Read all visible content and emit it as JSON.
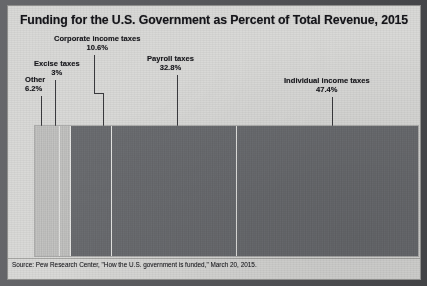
{
  "chart_data": {
    "type": "bar",
    "orientation": "horizontal-stacked",
    "title": "Funding for the U.S. Government as Percent of Total Revenue, 2015",
    "xlabel": "",
    "ylabel": "",
    "xlim": [
      0,
      100
    ],
    "grid": false,
    "legend": "none",
    "units": "percent of total revenue",
    "categories": [
      "Other",
      "Excise taxes",
      "Corporate income taxes",
      "Payroll taxes",
      "Individual income taxes"
    ],
    "values": [
      6.2,
      3,
      10.6,
      32.8,
      47.4
    ],
    "value_labels": [
      "6.2%",
      "3%",
      "10.6%",
      "32.8%",
      "47.4%"
    ],
    "colors": [
      "#c9c9c7",
      "#c9c9c7",
      "#6f7175",
      "#6f7175",
      "#6f7175"
    ],
    "annotations": [
      {
        "label": "Other",
        "value_label": "6.2%"
      },
      {
        "label": "Excise taxes",
        "value_label": "3%"
      },
      {
        "label": "Corporate income taxes",
        "value_label": "10.6%"
      },
      {
        "label": "Payroll taxes",
        "value_label": "32.8%"
      },
      {
        "label": "Individual income taxes",
        "value_label": "47.4%"
      }
    ],
    "source": "Source: Pew Research Center, \"How the U.S. government is funded,\" March 20, 2015."
  },
  "figure": {
    "title": "Funding for the U.S. Government as Percent of Total Revenue, 2015",
    "source": "Source: Pew Research Center, \"How the U.S. government is funded,\" March 20, 2015."
  },
  "labels": {
    "other": {
      "name": "Other",
      "pct": "6.2%"
    },
    "excise": {
      "name": "Excise taxes",
      "pct": "3%"
    },
    "corporate": {
      "name": "Corporate income taxes",
      "pct": "10.6%"
    },
    "payroll": {
      "name": "Payroll taxes",
      "pct": "32.8%"
    },
    "individual": {
      "name": "Individual income taxes",
      "pct": "47.4%"
    }
  }
}
